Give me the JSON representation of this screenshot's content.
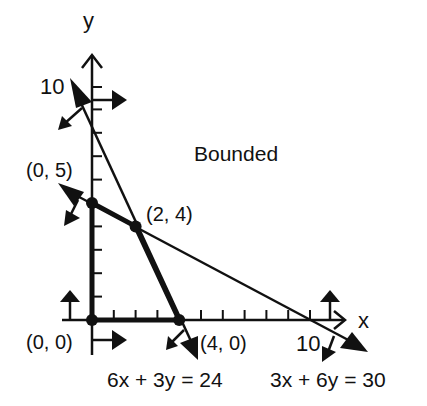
{
  "diagram": {
    "type": "linear-programming-feasible-region",
    "axes": {
      "x_label": "x",
      "y_label": "y",
      "x_tick_label": "10",
      "y_tick_label": "10"
    },
    "region_label": "Bounded",
    "vertices": [
      {
        "label": "(0, 0)",
        "x": 0,
        "y": 0
      },
      {
        "label": "(0, 5)",
        "x": 0,
        "y": 5
      },
      {
        "label": "(2, 4)",
        "x": 2,
        "y": 4
      },
      {
        "label": "(4, 0)",
        "x": 4,
        "y": 0
      }
    ],
    "constraints": [
      {
        "label": "6x + 3y = 24"
      },
      {
        "label": "3x + 6y = 30"
      }
    ],
    "colors": {
      "ink": "#111111",
      "background": "#ffffff"
    }
  }
}
